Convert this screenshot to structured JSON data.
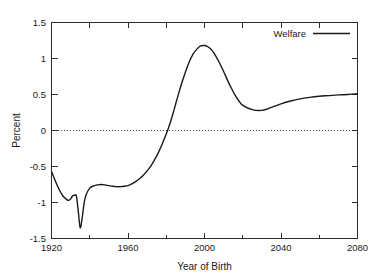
{
  "chart_data": {
    "type": "line",
    "title": "",
    "xlabel": "Year of Birth",
    "ylabel": "Percent",
    "xlim": [
      1920,
      2080
    ],
    "ylim": [
      -1.5,
      1.5
    ],
    "grid": false,
    "zero_reference_line": true,
    "legend_position": "top-right",
    "x_ticks": [
      1920,
      1960,
      2000,
      2040,
      2080
    ],
    "x_tick_labels": [
      "1920",
      "1960",
      "2000",
      "2040",
      "2080"
    ],
    "x_minor_ticks": [
      1940,
      1980,
      2020,
      2060
    ],
    "y_ticks": [
      -1.5,
      -1,
      -0.5,
      0,
      0.5,
      1,
      1.5
    ],
    "y_tick_labels": [
      "-1.5",
      "-1",
      "-0.5",
      "0",
      "0.5",
      "1",
      "1.5"
    ],
    "series": [
      {
        "name": "Welfare",
        "color": "#1a1a1a",
        "x": [
          1920,
          1922,
          1924,
          1926,
          1928,
          1929,
          1930,
          1931,
          1932,
          1933,
          1934,
          1935,
          1936,
          1937,
          1938,
          1940,
          1942,
          1944,
          1946,
          1948,
          1950,
          1952,
          1954,
          1956,
          1958,
          1960,
          1962,
          1964,
          1966,
          1968,
          1970,
          1972,
          1974,
          1976,
          1978,
          1980,
          1982,
          1984,
          1986,
          1988,
          1990,
          1992,
          1994,
          1996,
          1998,
          2000,
          2002,
          2004,
          2006,
          2008,
          2010,
          2012,
          2014,
          2016,
          2018,
          2020,
          2025,
          2030,
          2035,
          2040,
          2045,
          2050,
          2055,
          2060,
          2065,
          2070,
          2075,
          2080
        ],
        "y": [
          -0.57,
          -0.7,
          -0.82,
          -0.91,
          -0.96,
          -0.97,
          -0.95,
          -0.91,
          -0.9,
          -0.91,
          -1.12,
          -1.35,
          -1.22,
          -1.02,
          -0.9,
          -0.8,
          -0.77,
          -0.755,
          -0.75,
          -0.755,
          -0.765,
          -0.775,
          -0.78,
          -0.78,
          -0.775,
          -0.765,
          -0.74,
          -0.71,
          -0.67,
          -0.62,
          -0.56,
          -0.49,
          -0.4,
          -0.3,
          -0.18,
          -0.05,
          0.1,
          0.28,
          0.47,
          0.65,
          0.81,
          0.95,
          1.06,
          1.13,
          1.175,
          1.18,
          1.16,
          1.11,
          1.03,
          0.93,
          0.82,
          0.7,
          0.59,
          0.49,
          0.41,
          0.35,
          0.29,
          0.28,
          0.32,
          0.37,
          0.41,
          0.44,
          0.46,
          0.475,
          0.485,
          0.495,
          0.5,
          0.51
        ]
      }
    ],
    "notable_points": {
      "start_1920": -0.57,
      "local_min_1929": -0.97,
      "local_max_1932": -0.9,
      "global_min_1935": -1.35,
      "plateau_1956": -0.78,
      "zero_crossing": 1981,
      "global_max_2000": 1.18,
      "local_min_2030": 0.28,
      "end_2080": 0.51
    }
  },
  "legend": {
    "entries": [
      {
        "label": "Welfare"
      }
    ]
  }
}
